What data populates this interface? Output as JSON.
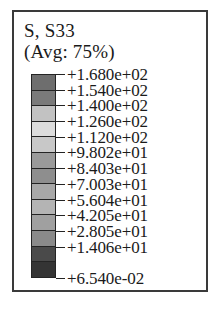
{
  "legend": {
    "title": "S, S33",
    "subtitle": "(Avg: 75%)",
    "frame_color": "#3a3a3a",
    "text_color": "#1a1a1a",
    "outline_color": "#242424",
    "labels": [
      "+1.680e+02",
      "+1.540e+02",
      "+1.400e+02",
      "+1.260e+02",
      "+1.120e+02",
      "+9.802e+01",
      "+8.403e+01",
      "+7.003e+01",
      "+5.604e+01",
      "+4.205e+01",
      "+2.805e+01",
      "+1.406e+01",
      "+6.540e-02"
    ],
    "band_colors": [
      "#6e6e6e",
      "#7a7a7a",
      "#c2c2c2",
      "#dcdcdc",
      "#c8c8c8",
      "#9a9a9a",
      "#8e8e8e",
      "#a8a8a8",
      "#b4b4b4",
      "#a0a0a0",
      "#8a8a8a",
      "#4a4a4a",
      "#343434"
    ]
  },
  "chart_data": {
    "type": "heatmap",
    "title": "S, S33",
    "subtitle": "(Avg: 75%)",
    "field": "S, S33",
    "averaging_percent": 75,
    "colormap": "grayscale-banded",
    "legend_position": "standalone",
    "grid": false,
    "n_bands": 13,
    "n_tick_labels": 13,
    "tick_labels": [
      "+1.680e+02",
      "+1.540e+02",
      "+1.400e+02",
      "+1.260e+02",
      "+1.120e+02",
      "+9.802e+01",
      "+8.403e+01",
      "+7.003e+01",
      "+5.604e+01",
      "+4.205e+01",
      "+2.805e+01",
      "+1.406e+01",
      "+6.540e-02"
    ],
    "tick_values": [
      168.0,
      154.0,
      140.0,
      126.0,
      112.0,
      98.02,
      84.03,
      70.03,
      56.04,
      42.05,
      28.05,
      14.06,
      0.0654
    ],
    "clim": [
      0.0654,
      168.0
    ],
    "xlabel": "",
    "ylabel": ""
  }
}
